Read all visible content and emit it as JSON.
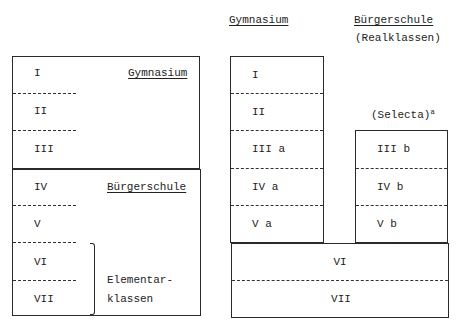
{
  "left_diagram": {
    "gymnasium_box": {
      "label": "Gymnasium",
      "classes": [
        "I",
        "II",
        "III"
      ]
    },
    "buergerschule_box": {
      "label": "Bürgerschule",
      "classes": [
        "IV",
        "V",
        "VI",
        "VII"
      ],
      "bracket_label_line1": "Elementar-",
      "bracket_label_line2": "klassen"
    }
  },
  "right_diagram": {
    "header_gymnasium": "Gymnasium",
    "header_buergerschule": "Bürgerschule",
    "header_realklassen": "(Realklassen)",
    "selecta_label": "(Selecta)",
    "selecta_footnote": "a",
    "gymnasium_column": [
      "I",
      "II",
      "III a",
      "IV a",
      "V a"
    ],
    "realklassen_column": [
      "III b",
      "IV b",
      "V b"
    ],
    "shared_bottom": [
      "VI",
      "VII"
    ]
  }
}
